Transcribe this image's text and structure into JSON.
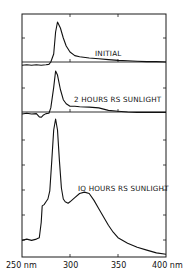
{
  "chart_data": {
    "type": "line",
    "title": "",
    "xlabel": "Wavelength (nm)",
    "ylabel": "",
    "xlim": [
      250,
      400
    ],
    "x_ticks": [
      250,
      300,
      350,
      400
    ],
    "x_tick_labels": [
      "250 nm",
      "300",
      "350",
      "400 nm"
    ],
    "grid": false,
    "legend": "none (panels annotated inline)",
    "panels": [
      {
        "name": "INITIAL",
        "label": "INITIAL",
        "baseline_relative": true,
        "x": [
          250,
          255,
          260,
          265,
          270,
          275,
          278,
          280,
          283,
          285,
          287,
          290,
          293,
          296,
          300,
          305,
          310,
          320,
          330,
          340,
          350,
          360,
          370,
          380,
          390,
          400
        ],
        "values": [
          -0.08,
          -0.07,
          -0.08,
          -0.07,
          -0.08,
          -0.07,
          -0.06,
          0.0,
          0.2,
          0.75,
          1.0,
          0.85,
          0.6,
          0.4,
          0.25,
          0.16,
          0.13,
          0.1,
          0.08,
          0.06,
          0.04,
          0.03,
          0.02,
          0.01,
          0.01,
          0.0
        ]
      },
      {
        "name": "2 HOURS RS SUNLIGHT",
        "label": "2 HOURS RS SUNLIGHT",
        "baseline_relative": true,
        "x": [
          250,
          255,
          260,
          265,
          268,
          270,
          272,
          275,
          278,
          280,
          283,
          285,
          287,
          290,
          293,
          296,
          300,
          305,
          310,
          320,
          330,
          340,
          350,
          360,
          370,
          380,
          390,
          400
        ],
        "values": [
          -0.05,
          -0.03,
          -0.05,
          -0.04,
          -0.12,
          -0.13,
          -0.08,
          -0.04,
          -0.03,
          0.1,
          0.6,
          1.0,
          0.9,
          0.55,
          0.3,
          0.2,
          0.14,
          0.14,
          0.13,
          0.12,
          0.1,
          0.04,
          0.02,
          0.0,
          -0.01,
          -0.01,
          -0.01,
          -0.01
        ]
      },
      {
        "name": "10 HOURS RS SUNLIGHT",
        "label": "10 HOURS RS SUNLIGHT",
        "baseline_relative": true,
        "x": [
          250,
          255,
          260,
          265,
          268,
          270,
          271,
          273,
          275,
          277,
          279,
          281,
          283,
          285,
          287,
          289,
          291,
          293,
          295,
          298,
          300,
          305,
          310,
          315,
          320,
          325,
          330,
          335,
          340,
          345,
          350,
          360,
          370,
          380,
          390,
          400
        ],
        "values": [
          0.12,
          0.13,
          0.12,
          0.13,
          0.14,
          0.25,
          0.37,
          0.38,
          0.4,
          0.42,
          0.48,
          0.7,
          0.92,
          1.0,
          0.92,
          0.7,
          0.5,
          0.42,
          0.4,
          0.39,
          0.4,
          0.43,
          0.46,
          0.47,
          0.46,
          0.41,
          0.35,
          0.29,
          0.23,
          0.18,
          0.14,
          0.1,
          0.07,
          0.05,
          0.03,
          0.02
        ]
      }
    ]
  },
  "labels": {
    "panel1": "INITIAL",
    "panel2": "2 HOURS RS SUNLIGHT",
    "panel3": "IO HOURS RS SUNLIGHT",
    "x250": "250 nm",
    "x300": "300",
    "x350": "350",
    "x400": "400 nm"
  }
}
